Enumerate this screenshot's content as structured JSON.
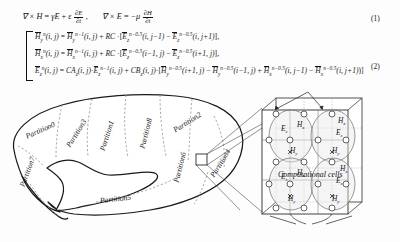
{
  "figure": {
    "background": "#fdfdfd",
    "ink": "#111111",
    "dashed_partition_color": "#999999"
  },
  "equations": {
    "maxwell": {
      "number": "(1)",
      "lhs1": "∇ × H",
      "eq1": "=",
      "rhs1_a": "γE",
      "rhs1_plus": "+",
      "rhs1_eps": "ε",
      "rhs1_frac_num": "∂E",
      "rhs1_frac_den": "∂t",
      "comma": ",",
      "lhs2": "∇ × E",
      "eq2": "=",
      "rhs2_sign": "−μ",
      "rhs2_frac_num": "∂H",
      "rhs2_frac_den": "∂t"
    },
    "fdtd": {
      "number": "(2)",
      "rows": [
        {
          "name": "hy-update",
          "lhs_field": "H",
          "lhs_sub": "y",
          "lhs_sup": "n",
          "lhs_args": "(i, j)",
          "eq": "=",
          "t1_field": "H",
          "t1_sub": "y",
          "t1_sup": "n−1",
          "t1_args": "(i, j)",
          "plus": "+",
          "coef": "RC",
          "dot": "·",
          "t2_field": "E",
          "t2_sub": "z",
          "t2_sup": "n−0.5",
          "t2_args": "(i, j−1)",
          "minus": "−",
          "t3_field": "E",
          "t3_sub": "z",
          "t3_sup": "n−0.5",
          "t3_args": "(i, j+1)",
          "tail": "],"
        },
        {
          "name": "hx-update",
          "lhs_field": "H",
          "lhs_sub": "x",
          "lhs_sup": "n",
          "lhs_args": "(i, j)",
          "eq": "=",
          "t1_field": "H",
          "t1_sub": "x",
          "t1_sup": "n−1",
          "t1_args": "(i, j)",
          "plus": "+",
          "coef": "RC",
          "dot": "·",
          "t2_field": "E",
          "t2_sub": "z",
          "t2_sup": "n−0.5",
          "t2_args": "(i−1, j)",
          "minus": "−",
          "t3_field": "E",
          "t3_sub": "z",
          "t3_sup": "n−0.5",
          "t3_args": "(i+1, j)",
          "tail": "],"
        },
        {
          "name": "ez-update",
          "lhs_field": "E",
          "lhs_sub": "z",
          "lhs_sup": "n",
          "lhs_args": "(i, j)",
          "eq": "=",
          "ca": "CA",
          "ca_sub": "z",
          "ca_args": "(i, j)",
          "dot0": "·",
          "t1_field": "E",
          "t1_sub": "z",
          "t1_sup": "n−1",
          "t1_args": "(i, j)",
          "plus": "+",
          "cb": "CB",
          "cb_sub": "z",
          "cb_args": "(i, j)",
          "dot": "·",
          "t2_field": "H",
          "t2_sub": "y",
          "t2_sup": "n−0.5",
          "t2_args": "(i+1, j)",
          "minus1": "−",
          "t3_field": "H",
          "t3_sub": "y",
          "t3_sup": "n−0.5",
          "t3_args": "(i−1, j)",
          "plus2": "+",
          "t4_field": "H",
          "t4_sub": "x",
          "t4_sup": "n−0.5",
          "t4_args": "(i, j−1)",
          "minus2": "−",
          "t5_field": "H",
          "t5_sub": "x",
          "t5_sup": "n−0.5",
          "t5_args": "(i, j+1)",
          "tail": ")]"
        }
      ]
    }
  },
  "diagram": {
    "brain_outline_label": "partitioned-brain-domain",
    "partitions": [
      {
        "id": 0,
        "label": "Partition0",
        "x": 37,
        "y": 37,
        "rot": -23
      },
      {
        "id": 3,
        "label": "Partition3",
        "x": 77,
        "y": 41,
        "rot": -58
      },
      {
        "id": 1,
        "label": "Partition1",
        "x": 110,
        "y": 41,
        "rot": -72
      },
      {
        "id": 8,
        "label": "Partition8",
        "x": 152,
        "y": 41,
        "rot": -78
      },
      {
        "id": 2,
        "label": "Partition2",
        "x": 184,
        "y": 34,
        "rot": -32
      },
      {
        "id": 7,
        "label": "Partition7",
        "x": 25,
        "y": 87,
        "rot": -72
      },
      {
        "id": 6,
        "label": "Partition6",
        "x": 181,
        "y": 79,
        "rot": -77
      },
      {
        "id": 4,
        "label": "Partition4",
        "x": 218,
        "y": 79,
        "rot": -60
      },
      {
        "id": 5,
        "label": "Partition5",
        "x": 105,
        "y": 100,
        "rot": -6
      }
    ],
    "callout": {
      "name": "zoom-region-square",
      "x": 196,
      "y": 70,
      "size": 11
    },
    "captions": {
      "cells": "Computational cells",
      "mesh": "Computational mesh"
    },
    "mesh": {
      "name": "yee-cell-mesh",
      "field_labels": [
        "E",
        "H",
        "H"
      ],
      "field_subs": [
        "z",
        "x",
        "y"
      ],
      "cells": [
        {
          "ez": "E",
          "ez_sub": "z",
          "hx": "H",
          "hx_sub": "x",
          "hy": "H",
          "hy_sub": "y"
        },
        {
          "ez": "E",
          "ez_sub": "z",
          "hx": "H",
          "hx_sub": "x",
          "hy": "H",
          "hy_sub": "y"
        },
        {
          "ez": "E",
          "ez_sub": "z",
          "hx": "H",
          "hx_sub": "x",
          "hy": "H",
          "hy_sub": "y"
        },
        {
          "ez": "E",
          "ez_sub": "z",
          "hx": "H",
          "hx_sub": "x",
          "hy": "H",
          "hy_sub": "y"
        }
      ]
    }
  }
}
